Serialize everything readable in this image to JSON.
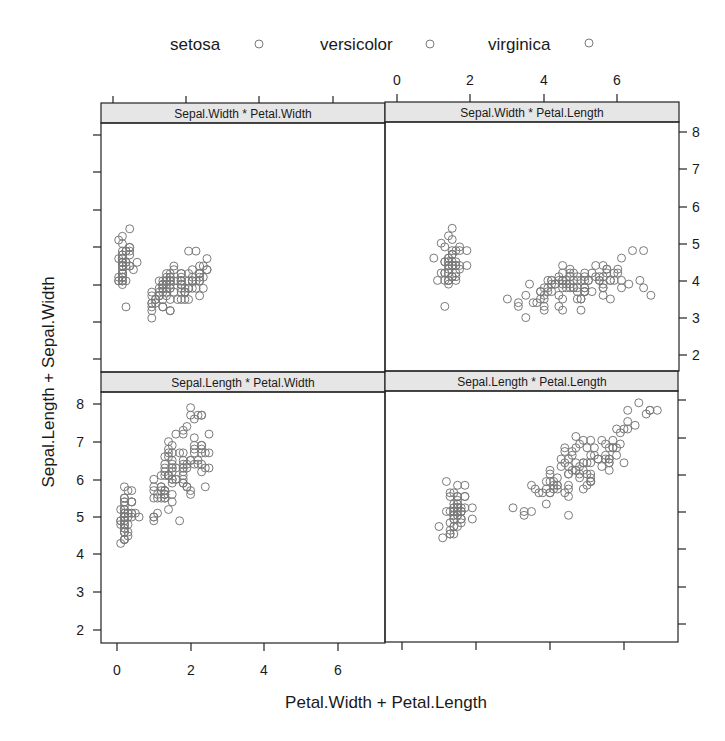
{
  "chart_data": {
    "type": "scatter",
    "title": "",
    "xlabel": "Petal.Width + Petal.Length",
    "ylabel": "Sepal.Length + Sepal.Width",
    "legend": {
      "position": "top",
      "entries": [
        {
          "label": "setosa",
          "symbol": "open-circle"
        },
        {
          "label": "versicolor",
          "symbol": "open-circle"
        },
        {
          "label": "virginica",
          "symbol": "open-circle"
        }
      ]
    },
    "marker_color": "#7a7a7a",
    "strip_color": "#e6e6e6",
    "grid": false,
    "panels": [
      {
        "name": "Sepal.Width * Petal.Width",
        "x": "Petal.Width",
        "y": "Sepal.Width",
        "row": 0,
        "col": 0,
        "xlim": [
          -0.3,
          7.4
        ],
        "ylim": [
          1.6,
          8.3
        ]
      },
      {
        "name": "Sepal.Width * Petal.Length",
        "x": "Petal.Length",
        "y": "Sepal.Width",
        "row": 0,
        "col": 1,
        "xlim": [
          -0.3,
          7.4
        ],
        "ylim": [
          1.6,
          8.3
        ]
      },
      {
        "name": "Sepal.Length * Petal.Width",
        "x": "Petal.Width",
        "y": "Sepal.Length",
        "row": 1,
        "col": 0,
        "xlim": [
          -0.3,
          7.4
        ],
        "ylim": [
          1.6,
          8.3
        ]
      },
      {
        "name": "Sepal.Length * Petal.Length",
        "x": "Petal.Length",
        "y": "Sepal.Length",
        "row": 1,
        "col": 1,
        "xlim": [
          -0.3,
          7.4
        ],
        "ylim": [
          1.6,
          8.3
        ]
      }
    ],
    "x_ticks": {
      "bottom_left": [
        "0",
        "2",
        "4",
        "6"
      ],
      "top_right": [
        "0",
        "2",
        "4",
        "6"
      ]
    },
    "y_ticks": {
      "left_bottom": [
        "2",
        "3",
        "4",
        "5",
        "6",
        "7",
        "8"
      ],
      "right_top": [
        "2",
        "3",
        "4",
        "5",
        "6",
        "7",
        "8"
      ]
    },
    "data": {
      "columns": [
        "Sepal.Length",
        "Sepal.Width",
        "Petal.Length",
        "Petal.Width",
        "Species"
      ],
      "rows": [
        [
          5.1,
          3.5,
          1.4,
          0.2,
          "setosa"
        ],
        [
          4.9,
          3.0,
          1.4,
          0.2,
          "setosa"
        ],
        [
          4.7,
          3.2,
          1.3,
          0.2,
          "setosa"
        ],
        [
          4.6,
          3.1,
          1.5,
          0.2,
          "setosa"
        ],
        [
          5.0,
          3.6,
          1.4,
          0.2,
          "setosa"
        ],
        [
          5.4,
          3.9,
          1.7,
          0.4,
          "setosa"
        ],
        [
          4.6,
          3.4,
          1.4,
          0.3,
          "setosa"
        ],
        [
          5.0,
          3.4,
          1.5,
          0.2,
          "setosa"
        ],
        [
          4.4,
          2.9,
          1.4,
          0.2,
          "setosa"
        ],
        [
          4.9,
          3.1,
          1.5,
          0.1,
          "setosa"
        ],
        [
          5.4,
          3.7,
          1.5,
          0.2,
          "setosa"
        ],
        [
          4.8,
          3.4,
          1.6,
          0.2,
          "setosa"
        ],
        [
          4.8,
          3.0,
          1.4,
          0.1,
          "setosa"
        ],
        [
          4.3,
          3.0,
          1.1,
          0.1,
          "setosa"
        ],
        [
          5.8,
          4.0,
          1.2,
          0.2,
          "setosa"
        ],
        [
          5.7,
          4.4,
          1.5,
          0.4,
          "setosa"
        ],
        [
          5.4,
          3.9,
          1.3,
          0.4,
          "setosa"
        ],
        [
          5.1,
          3.5,
          1.4,
          0.3,
          "setosa"
        ],
        [
          5.7,
          3.8,
          1.7,
          0.3,
          "setosa"
        ],
        [
          5.1,
          3.8,
          1.5,
          0.3,
          "setosa"
        ],
        [
          5.4,
          3.4,
          1.7,
          0.2,
          "setosa"
        ],
        [
          5.1,
          3.7,
          1.5,
          0.4,
          "setosa"
        ],
        [
          4.6,
          3.6,
          1.0,
          0.2,
          "setosa"
        ],
        [
          5.1,
          3.3,
          1.7,
          0.5,
          "setosa"
        ],
        [
          4.8,
          3.4,
          1.9,
          0.2,
          "setosa"
        ],
        [
          5.0,
          3.0,
          1.6,
          0.2,
          "setosa"
        ],
        [
          5.0,
          3.4,
          1.6,
          0.4,
          "setosa"
        ],
        [
          5.2,
          3.5,
          1.5,
          0.2,
          "setosa"
        ],
        [
          5.2,
          3.4,
          1.4,
          0.2,
          "setosa"
        ],
        [
          4.7,
          3.2,
          1.6,
          0.2,
          "setosa"
        ],
        [
          4.8,
          3.1,
          1.6,
          0.2,
          "setosa"
        ],
        [
          5.4,
          3.4,
          1.5,
          0.4,
          "setosa"
        ],
        [
          5.2,
          4.1,
          1.5,
          0.1,
          "setosa"
        ],
        [
          5.5,
          4.2,
          1.4,
          0.2,
          "setosa"
        ],
        [
          4.9,
          3.1,
          1.5,
          0.2,
          "setosa"
        ],
        [
          5.0,
          3.2,
          1.2,
          0.2,
          "setosa"
        ],
        [
          5.5,
          3.5,
          1.3,
          0.2,
          "setosa"
        ],
        [
          4.9,
          3.6,
          1.4,
          0.1,
          "setosa"
        ],
        [
          4.4,
          3.0,
          1.3,
          0.2,
          "setosa"
        ],
        [
          5.1,
          3.4,
          1.5,
          0.2,
          "setosa"
        ],
        [
          5.0,
          3.5,
          1.3,
          0.3,
          "setosa"
        ],
        [
          4.5,
          2.3,
          1.3,
          0.3,
          "setosa"
        ],
        [
          4.4,
          3.2,
          1.3,
          0.2,
          "setosa"
        ],
        [
          5.0,
          3.5,
          1.6,
          0.6,
          "setosa"
        ],
        [
          5.1,
          3.8,
          1.9,
          0.4,
          "setosa"
        ],
        [
          4.8,
          3.0,
          1.4,
          0.3,
          "setosa"
        ],
        [
          5.1,
          3.8,
          1.6,
          0.2,
          "setosa"
        ],
        [
          4.6,
          3.2,
          1.4,
          0.2,
          "setosa"
        ],
        [
          5.3,
          3.7,
          1.5,
          0.2,
          "setosa"
        ],
        [
          5.0,
          3.3,
          1.4,
          0.2,
          "setosa"
        ],
        [
          7.0,
          3.2,
          4.7,
          1.4,
          "versicolor"
        ],
        [
          6.4,
          3.2,
          4.5,
          1.5,
          "versicolor"
        ],
        [
          6.9,
          3.1,
          4.9,
          1.5,
          "versicolor"
        ],
        [
          5.5,
          2.3,
          4.0,
          1.3,
          "versicolor"
        ],
        [
          6.5,
          2.8,
          4.6,
          1.5,
          "versicolor"
        ],
        [
          5.7,
          2.8,
          4.5,
          1.3,
          "versicolor"
        ],
        [
          6.3,
          3.3,
          4.7,
          1.6,
          "versicolor"
        ],
        [
          4.9,
          2.4,
          3.3,
          1.0,
          "versicolor"
        ],
        [
          6.6,
          2.9,
          4.6,
          1.3,
          "versicolor"
        ],
        [
          5.2,
          2.7,
          3.9,
          1.4,
          "versicolor"
        ],
        [
          5.0,
          2.0,
          3.5,
          1.0,
          "versicolor"
        ],
        [
          5.9,
          3.0,
          4.2,
          1.5,
          "versicolor"
        ],
        [
          6.0,
          2.2,
          4.0,
          1.0,
          "versicolor"
        ],
        [
          6.1,
          2.9,
          4.7,
          1.4,
          "versicolor"
        ],
        [
          5.6,
          2.9,
          3.6,
          1.3,
          "versicolor"
        ],
        [
          6.7,
          3.1,
          4.4,
          1.4,
          "versicolor"
        ],
        [
          5.6,
          3.0,
          4.5,
          1.5,
          "versicolor"
        ],
        [
          5.8,
          2.7,
          4.1,
          1.0,
          "versicolor"
        ],
        [
          6.2,
          2.2,
          4.5,
          1.5,
          "versicolor"
        ],
        [
          5.6,
          2.5,
          3.9,
          1.1,
          "versicolor"
        ],
        [
          5.9,
          3.2,
          4.8,
          1.8,
          "versicolor"
        ],
        [
          6.1,
          2.8,
          4.0,
          1.3,
          "versicolor"
        ],
        [
          6.3,
          2.5,
          4.9,
          1.5,
          "versicolor"
        ],
        [
          6.1,
          2.8,
          4.7,
          1.2,
          "versicolor"
        ],
        [
          6.4,
          2.9,
          4.3,
          1.3,
          "versicolor"
        ],
        [
          6.6,
          3.0,
          4.4,
          1.4,
          "versicolor"
        ],
        [
          6.8,
          2.8,
          4.8,
          1.4,
          "versicolor"
        ],
        [
          6.7,
          3.0,
          5.0,
          1.7,
          "versicolor"
        ],
        [
          6.0,
          2.9,
          4.5,
          1.5,
          "versicolor"
        ],
        [
          5.7,
          2.6,
          3.5,
          1.0,
          "versicolor"
        ],
        [
          5.5,
          2.4,
          3.8,
          1.1,
          "versicolor"
        ],
        [
          5.5,
          2.4,
          3.7,
          1.0,
          "versicolor"
        ],
        [
          5.8,
          2.7,
          3.9,
          1.2,
          "versicolor"
        ],
        [
          6.0,
          2.7,
          5.1,
          1.6,
          "versicolor"
        ],
        [
          5.4,
          3.0,
          4.5,
          1.5,
          "versicolor"
        ],
        [
          6.0,
          3.4,
          4.5,
          1.6,
          "versicolor"
        ],
        [
          6.7,
          3.1,
          4.7,
          1.5,
          "versicolor"
        ],
        [
          6.3,
          2.3,
          4.4,
          1.3,
          "versicolor"
        ],
        [
          5.6,
          3.0,
          4.1,
          1.3,
          "versicolor"
        ],
        [
          5.5,
          2.5,
          4.0,
          1.3,
          "versicolor"
        ],
        [
          5.5,
          2.6,
          4.4,
          1.2,
          "versicolor"
        ],
        [
          6.1,
          3.0,
          4.6,
          1.4,
          "versicolor"
        ],
        [
          5.8,
          2.6,
          4.0,
          1.2,
          "versicolor"
        ],
        [
          5.0,
          2.3,
          3.3,
          1.0,
          "versicolor"
        ],
        [
          5.6,
          2.7,
          4.2,
          1.3,
          "versicolor"
        ],
        [
          5.7,
          3.0,
          4.2,
          1.2,
          "versicolor"
        ],
        [
          5.7,
          2.9,
          4.2,
          1.3,
          "versicolor"
        ],
        [
          6.2,
          2.9,
          4.3,
          1.3,
          "versicolor"
        ],
        [
          5.1,
          2.5,
          3.0,
          1.1,
          "versicolor"
        ],
        [
          5.7,
          2.8,
          4.1,
          1.3,
          "versicolor"
        ],
        [
          6.3,
          3.3,
          6.0,
          2.5,
          "virginica"
        ],
        [
          5.8,
          2.7,
          5.1,
          1.9,
          "virginica"
        ],
        [
          7.1,
          3.0,
          5.9,
          2.1,
          "virginica"
        ],
        [
          6.3,
          2.9,
          5.6,
          1.8,
          "virginica"
        ],
        [
          6.5,
          3.0,
          5.8,
          2.2,
          "virginica"
        ],
        [
          7.6,
          3.0,
          6.6,
          2.1,
          "virginica"
        ],
        [
          4.9,
          2.5,
          4.5,
          1.7,
          "virginica"
        ],
        [
          7.3,
          2.9,
          6.3,
          1.8,
          "virginica"
        ],
        [
          6.7,
          2.5,
          5.8,
          1.8,
          "virginica"
        ],
        [
          7.2,
          3.6,
          6.1,
          2.5,
          "virginica"
        ],
        [
          6.5,
          3.2,
          5.1,
          2.0,
          "virginica"
        ],
        [
          6.4,
          2.7,
          5.3,
          1.9,
          "virginica"
        ],
        [
          6.8,
          3.0,
          5.5,
          2.1,
          "virginica"
        ],
        [
          5.7,
          2.5,
          5.0,
          2.0,
          "virginica"
        ],
        [
          5.8,
          2.8,
          5.1,
          2.4,
          "virginica"
        ],
        [
          6.4,
          3.2,
          5.3,
          2.3,
          "virginica"
        ],
        [
          6.5,
          3.0,
          5.5,
          1.8,
          "virginica"
        ],
        [
          7.7,
          3.8,
          6.7,
          2.2,
          "virginica"
        ],
        [
          7.7,
          2.6,
          6.9,
          2.3,
          "virginica"
        ],
        [
          6.0,
          2.2,
          5.0,
          1.5,
          "virginica"
        ],
        [
          6.9,
          3.2,
          5.7,
          2.3,
          "virginica"
        ],
        [
          5.6,
          2.8,
          4.9,
          2.0,
          "virginica"
        ],
        [
          7.7,
          2.8,
          6.7,
          2.0,
          "virginica"
        ],
        [
          6.3,
          2.7,
          4.9,
          1.8,
          "virginica"
        ],
        [
          6.7,
          3.3,
          5.7,
          2.1,
          "virginica"
        ],
        [
          7.2,
          3.2,
          6.0,
          1.8,
          "virginica"
        ],
        [
          6.2,
          2.8,
          4.8,
          1.8,
          "virginica"
        ],
        [
          6.1,
          3.0,
          4.9,
          1.8,
          "virginica"
        ],
        [
          6.4,
          2.8,
          5.6,
          2.1,
          "virginica"
        ],
        [
          7.2,
          3.0,
          5.8,
          1.6,
          "virginica"
        ],
        [
          7.4,
          2.8,
          6.1,
          1.9,
          "virginica"
        ],
        [
          7.9,
          3.8,
          6.4,
          2.0,
          "virginica"
        ],
        [
          6.4,
          2.8,
          5.6,
          2.2,
          "virginica"
        ],
        [
          6.3,
          2.8,
          5.1,
          1.5,
          "virginica"
        ],
        [
          6.1,
          2.6,
          5.6,
          1.4,
          "virginica"
        ],
        [
          7.7,
          3.0,
          6.1,
          2.3,
          "virginica"
        ],
        [
          6.3,
          3.4,
          5.6,
          2.4,
          "virginica"
        ],
        [
          6.4,
          3.1,
          5.5,
          1.8,
          "virginica"
        ],
        [
          6.0,
          3.0,
          4.8,
          1.8,
          "virginica"
        ],
        [
          6.9,
          3.1,
          5.4,
          2.1,
          "virginica"
        ],
        [
          6.7,
          3.1,
          5.6,
          2.4,
          "virginica"
        ],
        [
          6.9,
          3.1,
          5.1,
          2.3,
          "virginica"
        ],
        [
          5.8,
          2.7,
          5.1,
          1.9,
          "virginica"
        ],
        [
          6.8,
          3.2,
          5.9,
          2.3,
          "virginica"
        ],
        [
          6.7,
          3.3,
          5.7,
          2.5,
          "virginica"
        ],
        [
          6.7,
          3.0,
          5.2,
          2.3,
          "virginica"
        ],
        [
          6.3,
          2.5,
          5.0,
          1.9,
          "virginica"
        ],
        [
          6.5,
          3.0,
          5.2,
          2.0,
          "virginica"
        ],
        [
          6.2,
          3.4,
          5.4,
          2.3,
          "virginica"
        ],
        [
          5.9,
          3.0,
          5.1,
          1.8,
          "virginica"
        ]
      ]
    }
  }
}
